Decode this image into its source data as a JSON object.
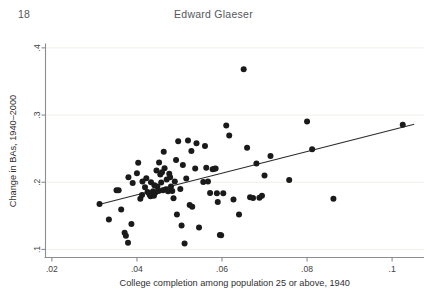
{
  "running_head": {
    "page_number": "18",
    "title": "Edward Glaeser"
  },
  "chart_data": {
    "type": "scatter",
    "title": "",
    "subtitle": "",
    "xlabel": "College completion among population 25 or above, 1940",
    "ylabel": "Change in BAs, 1940–2000",
    "xlim": [
      0.0185,
      0.1075
    ],
    "ylim": [
      0.088,
      0.405
    ],
    "xticks": [
      0.02,
      0.04,
      0.06,
      0.08,
      0.1
    ],
    "xticklabels": [
      ".02",
      ".04",
      ".06",
      ".08",
      ".1"
    ],
    "yticks": [
      0.1,
      0.2,
      0.3,
      0.4
    ],
    "yticklabels": [
      ".1",
      ".2",
      ".3",
      ".4"
    ],
    "grid": "horizontal",
    "gridcolor": "#f2efe7",
    "legend": "none",
    "marker_color": "#1a1a1a",
    "marker_size": 3.0,
    "fitline": {
      "name": "linear fit",
      "color": "#2a2a2a",
      "x": [
        0.0313,
        0.1052
      ],
      "y": [
        0.1672,
        0.2862
      ]
    },
    "points": [
      {
        "x": 0.0312,
        "y": 0.1675
      },
      {
        "x": 0.0334,
        "y": 0.1445
      },
      {
        "x": 0.0352,
        "y": 0.188
      },
      {
        "x": 0.0357,
        "y": 0.188
      },
      {
        "x": 0.0363,
        "y": 0.1595
      },
      {
        "x": 0.0371,
        "y": 0.125
      },
      {
        "x": 0.0374,
        "y": 0.1205
      },
      {
        "x": 0.0379,
        "y": 0.11
      },
      {
        "x": 0.038,
        "y": 0.2075
      },
      {
        "x": 0.0387,
        "y": 0.138
      },
      {
        "x": 0.039,
        "y": 0.199
      },
      {
        "x": 0.04,
        "y": 0.2135
      },
      {
        "x": 0.0403,
        "y": 0.229
      },
      {
        "x": 0.0408,
        "y": 0.1755
      },
      {
        "x": 0.0412,
        "y": 0.181
      },
      {
        "x": 0.0413,
        "y": 0.201
      },
      {
        "x": 0.0419,
        "y": 0.1925
      },
      {
        "x": 0.0422,
        "y": 0.206
      },
      {
        "x": 0.0425,
        "y": 0.1855
      },
      {
        "x": 0.0428,
        "y": 0.184
      },
      {
        "x": 0.043,
        "y": 0.1815
      },
      {
        "x": 0.0432,
        "y": 0.179
      },
      {
        "x": 0.0433,
        "y": 0.2
      },
      {
        "x": 0.0436,
        "y": 0.183
      },
      {
        "x": 0.0438,
        "y": 0.1865
      },
      {
        "x": 0.044,
        "y": 0.18
      },
      {
        "x": 0.0441,
        "y": 0.1955
      },
      {
        "x": 0.0443,
        "y": 0.1845
      },
      {
        "x": 0.0446,
        "y": 0.2175
      },
      {
        "x": 0.0448,
        "y": 0.1935
      },
      {
        "x": 0.0451,
        "y": 0.187
      },
      {
        "x": 0.0452,
        "y": 0.2295
      },
      {
        "x": 0.0455,
        "y": 0.2115
      },
      {
        "x": 0.0457,
        "y": 0.1995
      },
      {
        "x": 0.0459,
        "y": 0.215
      },
      {
        "x": 0.0461,
        "y": 0.188
      },
      {
        "x": 0.0463,
        "y": 0.2455
      },
      {
        "x": 0.0465,
        "y": 0.221
      },
      {
        "x": 0.0468,
        "y": 0.1895
      },
      {
        "x": 0.047,
        "y": 0.204
      },
      {
        "x": 0.0473,
        "y": 0.1865
      },
      {
        "x": 0.0476,
        "y": 0.2125
      },
      {
        "x": 0.0478,
        "y": 0.2075
      },
      {
        "x": 0.048,
        "y": 0.1935
      },
      {
        "x": 0.0483,
        "y": 0.187
      },
      {
        "x": 0.0486,
        "y": 0.176
      },
      {
        "x": 0.0489,
        "y": 0.201
      },
      {
        "x": 0.0492,
        "y": 0.233
      },
      {
        "x": 0.0494,
        "y": 0.152
      },
      {
        "x": 0.0497,
        "y": 0.261
      },
      {
        "x": 0.0502,
        "y": 0.19
      },
      {
        "x": 0.0505,
        "y": 0.1355
      },
      {
        "x": 0.0508,
        "y": 0.2255
      },
      {
        "x": 0.0512,
        "y": 0.109
      },
      {
        "x": 0.0516,
        "y": 0.2055
      },
      {
        "x": 0.052,
        "y": 0.262
      },
      {
        "x": 0.0524,
        "y": 0.166
      },
      {
        "x": 0.0528,
        "y": 0.2465
      },
      {
        "x": 0.053,
        "y": 0.1635
      },
      {
        "x": 0.0537,
        "y": 0.2205
      },
      {
        "x": 0.054,
        "y": 0.258
      },
      {
        "x": 0.0546,
        "y": 0.1325
      },
      {
        "x": 0.0556,
        "y": 0.2005
      },
      {
        "x": 0.056,
        "y": 0.254
      },
      {
        "x": 0.0563,
        "y": 0.2215
      },
      {
        "x": 0.0567,
        "y": 0.201
      },
      {
        "x": 0.0572,
        "y": 0.184
      },
      {
        "x": 0.0578,
        "y": 0.2195
      },
      {
        "x": 0.0582,
        "y": 0.22
      },
      {
        "x": 0.0585,
        "y": 0.2205
      },
      {
        "x": 0.0588,
        "y": 0.1835
      },
      {
        "x": 0.059,
        "y": 0.1705
      },
      {
        "x": 0.0595,
        "y": 0.1215
      },
      {
        "x": 0.0598,
        "y": 0.121
      },
      {
        "x": 0.0603,
        "y": 0.1835
      },
      {
        "x": 0.061,
        "y": 0.2845
      },
      {
        "x": 0.0617,
        "y": 0.2695
      },
      {
        "x": 0.0627,
        "y": 0.1745
      },
      {
        "x": 0.064,
        "y": 0.152
      },
      {
        "x": 0.0651,
        "y": 0.368
      },
      {
        "x": 0.0659,
        "y": 0.2515
      },
      {
        "x": 0.0666,
        "y": 0.1775
      },
      {
        "x": 0.0673,
        "y": 0.1765
      },
      {
        "x": 0.0681,
        "y": 0.228
      },
      {
        "x": 0.0688,
        "y": 0.177
      },
      {
        "x": 0.0694,
        "y": 0.18
      },
      {
        "x": 0.07,
        "y": 0.21
      },
      {
        "x": 0.0714,
        "y": 0.239
      },
      {
        "x": 0.0758,
        "y": 0.2035
      },
      {
        "x": 0.08,
        "y": 0.2905
      },
      {
        "x": 0.0812,
        "y": 0.249
      },
      {
        "x": 0.0862,
        "y": 0.1755
      },
      {
        "x": 0.1025,
        "y": 0.2855
      }
    ]
  }
}
